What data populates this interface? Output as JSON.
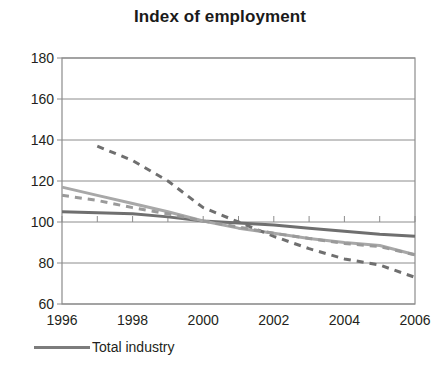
{
  "chart_data": {
    "type": "line",
    "title": "Index of employment",
    "xlabel": "",
    "ylabel": "",
    "xlim": [
      1996,
      2006
    ],
    "ylim": [
      60,
      180
    ],
    "grid": true,
    "y_ticks": [
      180,
      160,
      140,
      120,
      100,
      80,
      60
    ],
    "x_ticks": [
      1996,
      1998,
      2000,
      2002,
      2004,
      2006
    ],
    "x_minor_ticks": [
      1996,
      1997,
      1998,
      1999,
      2000,
      2001,
      2002,
      2003,
      2004,
      2005,
      2006
    ],
    "legend_position": "below-axis-left",
    "x": [
      1996,
      1997,
      1998,
      1999,
      2000,
      2001,
      2002,
      2003,
      2004,
      2005,
      2006
    ],
    "series": [
      {
        "name": "Total industry",
        "style": "solid",
        "color": "#6f6f6f",
        "width": 3,
        "values": [
          105,
          104.5,
          104,
          102.5,
          100.5,
          99.5,
          98.5,
          97,
          95.5,
          94,
          93
        ]
      },
      {
        "name": "series-light-solid",
        "style": "solid",
        "color": "#a8a8a8",
        "width": 3,
        "values": [
          117,
          113,
          109,
          105,
          100.5,
          97,
          94.5,
          92,
          90,
          88.5,
          84
        ]
      },
      {
        "name": "series-steep-dashed",
        "style": "dashed",
        "color": "#6f6f6f",
        "width": 3,
        "values": [
          null,
          137,
          130,
          120,
          107,
          100,
          93,
          87,
          82,
          79,
          73
        ]
      },
      {
        "name": "series-shallow-dashed",
        "style": "dashed",
        "color": "#9a9a9a",
        "width": 3,
        "values": [
          113,
          110.5,
          107,
          104,
          100.5,
          97.5,
          94.5,
          92,
          89.5,
          88,
          84
        ]
      }
    ]
  },
  "legend": {
    "entries": [
      {
        "label": "Total industry",
        "color": "#7c7c7c",
        "style": "solid"
      }
    ]
  },
  "axes": {
    "frame_color": "#8c8c8c",
    "grid_color": "#8c8c8c"
  }
}
